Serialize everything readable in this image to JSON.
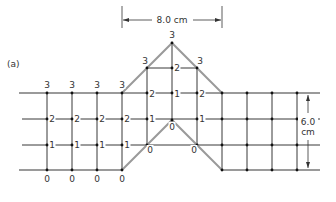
{
  "figure": {
    "panel_label": "(a)",
    "width_dimension": "8.0 cm",
    "height_dimension_value": "6.0",
    "height_dimension_unit": "cm",
    "colors": {
      "grid": "#222222",
      "boundary": "#999999",
      "text": "#333333"
    }
  },
  "grid": {
    "rows_y": [
      93,
      119,
      145,
      170
    ],
    "left_columns_x": [
      47,
      72,
      97,
      122
    ],
    "right_columns_x": [
      222,
      247,
      272,
      297
    ]
  },
  "labels": [
    {
      "text": "3",
      "x": 47,
      "y": 88
    },
    {
      "text": "3",
      "x": 72,
      "y": 88
    },
    {
      "text": "3",
      "x": 97,
      "y": 88
    },
    {
      "text": "3",
      "x": 122,
      "y": 88
    },
    {
      "text": "3",
      "x": 145,
      "y": 64
    },
    {
      "text": "3",
      "x": 172,
      "y": 38
    },
    {
      "text": "3",
      "x": 200,
      "y": 64
    },
    {
      "text": "2",
      "x": 52,
      "y": 122
    },
    {
      "text": "2",
      "x": 77,
      "y": 122
    },
    {
      "text": "2",
      "x": 102,
      "y": 122
    },
    {
      "text": "2",
      "x": 127,
      "y": 122
    },
    {
      "text": "1",
      "x": 152,
      "y": 122
    },
    {
      "text": "2",
      "x": 152,
      "y": 97
    },
    {
      "text": "1",
      "x": 177,
      "y": 97
    },
    {
      "text": "2",
      "x": 202,
      "y": 97
    },
    {
      "text": "2",
      "x": 177,
      "y": 71
    },
    {
      "text": "1",
      "x": 202,
      "y": 122
    },
    {
      "text": "1",
      "x": 52,
      "y": 148
    },
    {
      "text": "1",
      "x": 77,
      "y": 148
    },
    {
      "text": "1",
      "x": 102,
      "y": 148
    },
    {
      "text": "1",
      "x": 127,
      "y": 148
    },
    {
      "text": "0",
      "x": 150,
      "y": 153
    },
    {
      "text": "0",
      "x": 172,
      "y": 130
    },
    {
      "text": "0",
      "x": 194,
      "y": 153
    },
    {
      "text": "0",
      "x": 47,
      "y": 182
    },
    {
      "text": "0",
      "x": 72,
      "y": 182
    },
    {
      "text": "0",
      "x": 97,
      "y": 182
    },
    {
      "text": "0",
      "x": 122,
      "y": 182
    }
  ]
}
